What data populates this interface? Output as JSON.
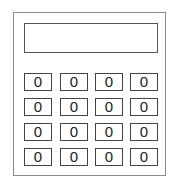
{
  "calculator": {
    "display": {
      "value": ""
    },
    "buttons": [
      [
        "0",
        "0",
        "0",
        "0"
      ],
      [
        "0",
        "0",
        "0",
        "0"
      ],
      [
        "0",
        "0",
        "0",
        "0"
      ],
      [
        "0",
        "0",
        "0",
        "0"
      ]
    ]
  }
}
